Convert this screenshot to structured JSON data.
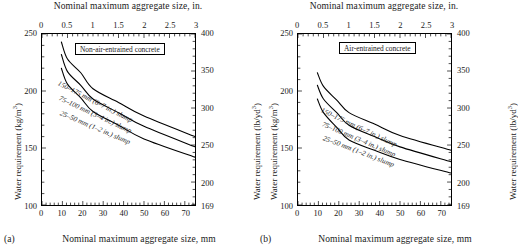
{
  "figure": {
    "panels": [
      {
        "tag": "(a)",
        "legend": "Non-air-entrained concrete",
        "top_axis_title": "Nominal maximum aggregate size, in.",
        "bottom_axis_title": "Nominal maximum aggregate size, mm",
        "left_axis_title": "Water requirement (kg/m",
        "left_axis_unit_exp": "3",
        "left_axis_title_tail": ")",
        "right_axis_title": "Water requirement (lb/yd",
        "right_axis_unit_exp": "3",
        "right_axis_title_tail": ")",
        "top_ticks": [
          "0",
          "0.5",
          "1",
          "1.5",
          "2",
          "2.5",
          "3"
        ],
        "bottom_ticks": [
          "0",
          "10",
          "20",
          "30",
          "40",
          "50",
          "60",
          "70"
        ],
        "left_ticks": [
          "250",
          "200",
          "150",
          "100"
        ],
        "right_ticks": [
          "400",
          "350",
          "300",
          "250",
          "200",
          "169"
        ],
        "curve_labels": [
          "150–175 mm (6–7 in.) slump",
          "75–100 mm (3–4 in.) slump",
          "25–50 mm (1–2 in.) slump"
        ]
      },
      {
        "tag": "(b)",
        "legend": "Air-entrained concrete",
        "top_axis_title": "Nominal maximum aggregate size, in.",
        "bottom_axis_title": "Nominal maximum aggregate size, mm",
        "left_axis_title": "Water requirement (kg/m",
        "left_axis_unit_exp": "3",
        "left_axis_title_tail": ")",
        "right_axis_title": "Water requirement (lb/yd",
        "right_axis_unit_exp": "3",
        "right_axis_title_tail": ")",
        "top_ticks": [
          "0",
          "0.5",
          "1",
          "1.5",
          "2",
          "2.5",
          "3"
        ],
        "bottom_ticks": [
          "0",
          "10",
          "20",
          "30",
          "40",
          "50",
          "60",
          "70"
        ],
        "left_ticks": [
          "250",
          "200",
          "150",
          "100"
        ],
        "right_ticks": [
          "400",
          "350",
          "300",
          "250",
          "200",
          "169"
        ],
        "curve_labels": [
          "150–175 mm (6–7 in.) slump",
          "75–100 mm (3–4 in.) slump",
          "25–50 mm (1–2 in.) slump"
        ]
      }
    ]
  },
  "chart_data": [
    {
      "type": "line",
      "title": "Non-air-entrained concrete",
      "panel": "(a)",
      "xlabel": "Nominal maximum aggregate size, mm",
      "ylabel": "Water requirement (kg/m3)",
      "xlabel_secondary": "Nominal maximum aggregate size, in.",
      "ylabel_secondary": "Water requirement (lb/yd3)",
      "xlim": [
        0,
        75
      ],
      "ylim": [
        100,
        250
      ],
      "xlim_secondary": [
        0,
        3
      ],
      "ylim_secondary": [
        169,
        400
      ],
      "xticks": [
        0,
        10,
        20,
        30,
        40,
        50,
        60,
        70
      ],
      "xticks_secondary": [
        0,
        0.5,
        1,
        1.5,
        2,
        2.5,
        3
      ],
      "yticks": [
        100,
        150,
        200,
        250
      ],
      "yticks_secondary": [
        169,
        200,
        250,
        300,
        350,
        400
      ],
      "grid": false,
      "legend_position": "inside-top-center",
      "x": [
        9.5,
        12.5,
        19,
        25,
        37.5,
        50,
        75
      ],
      "series": [
        {
          "name": "150–175 mm (6–7 in.) slump",
          "values": [
            243,
            228,
            216,
            202,
            190,
            178,
            160
          ],
          "color": "#000000"
        },
        {
          "name": "75–100 mm (3–4 in.) slump",
          "values": [
            232,
            217,
            205,
            193,
            181,
            169,
            151
          ],
          "color": "#000000"
        },
        {
          "name": "25–50 mm (1–2 in.) slump",
          "values": [
            220,
            206,
            194,
            182,
            170,
            158,
            142
          ],
          "color": "#000000"
        }
      ]
    },
    {
      "type": "line",
      "title": "Air-entrained concrete",
      "panel": "(b)",
      "xlabel": "Nominal maximum aggregate size, mm",
      "ylabel": "Water requirement (kg/m3)",
      "xlabel_secondary": "Nominal maximum aggregate size, in.",
      "ylabel_secondary": "Water requirement (lb/yd3)",
      "xlim": [
        0,
        75
      ],
      "ylim": [
        100,
        250
      ],
      "xlim_secondary": [
        0,
        3
      ],
      "ylim_secondary": [
        169,
        400
      ],
      "xticks": [
        0,
        10,
        20,
        30,
        40,
        50,
        60,
        70
      ],
      "xticks_secondary": [
        0,
        0.5,
        1,
        1.5,
        2,
        2.5,
        3
      ],
      "yticks": [
        100,
        150,
        200,
        250
      ],
      "yticks_secondary": [
        169,
        200,
        250,
        300,
        350,
        400
      ],
      "grid": false,
      "legend_position": "inside-top-center",
      "x": [
        9.5,
        12.5,
        19,
        25,
        37.5,
        50,
        75
      ],
      "series": [
        {
          "name": "150–175 mm (6–7 in.) slump",
          "values": [
            216,
            204,
            192,
            181,
            171,
            161,
            148
          ],
          "color": "#000000"
        },
        {
          "name": "75–100 mm (3–4 in.) slump",
          "values": [
            205,
            193,
            181,
            170,
            160,
            151,
            138
          ],
          "color": "#000000"
        },
        {
          "name": "25–50 mm (1–2 in.) slump",
          "values": [
            193,
            181,
            168,
            157,
            148,
            140,
            128
          ],
          "color": "#000000"
        }
      ]
    }
  ]
}
